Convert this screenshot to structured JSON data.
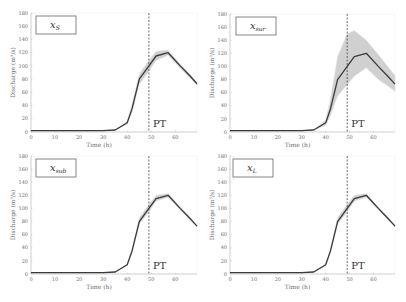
{
  "figure": {
    "width": 406,
    "height": 302,
    "line_color": "#3a3a3a",
    "band_color": "#c8c8c8",
    "band_edge_color": "#e4e4e4",
    "axis_color": "#bdbdbd",
    "pt_line_color": "#444444"
  },
  "chart_data": [
    {
      "type": "line",
      "panel": "top-left",
      "title": "x_S",
      "title_main": "x",
      "title_sub": "S",
      "xlabel": "Time (h)",
      "ylabel": "Discharge (m³/s)",
      "xlim": [
        0,
        69
      ],
      "ylim": [
        0,
        180
      ],
      "xticks": [
        0,
        10,
        20,
        30,
        40,
        50,
        60
      ],
      "yticks": [
        0,
        20,
        40,
        60,
        80,
        100,
        120,
        140,
        160,
        180
      ],
      "annotation": {
        "text": "PT",
        "x": 49
      },
      "series": [
        {
          "name": "Discharge",
          "x": [
            0,
            10,
            20,
            30,
            35,
            40,
            42,
            45,
            49,
            52,
            57,
            62,
            66,
            69
          ],
          "values": [
            2,
            2,
            2,
            2,
            3,
            14,
            35,
            80,
            100,
            115,
            120,
            100,
            85,
            73
          ]
        }
      ],
      "band": {
        "lower": [
          2,
          2,
          2,
          2,
          3,
          12,
          30,
          72,
          92,
          108,
          116,
          97,
          82,
          71
        ],
        "upper": [
          2,
          2,
          2,
          2,
          3,
          16,
          42,
          88,
          108,
          122,
          124,
          103,
          88,
          75
        ]
      }
    },
    {
      "type": "line",
      "panel": "top-right",
      "title": "x_sur",
      "title_main": "x",
      "title_sub": "sur",
      "xlabel": "Time (h)",
      "ylabel": "Discharge (m³/s)",
      "xlim": [
        0,
        69
      ],
      "ylim": [
        0,
        180
      ],
      "xticks": [
        0,
        10,
        20,
        30,
        40,
        50,
        60
      ],
      "yticks": [
        0,
        20,
        40,
        60,
        80,
        100,
        120,
        140,
        160,
        180
      ],
      "annotation": {
        "text": "PT",
        "x": 49
      },
      "series": [
        {
          "name": "Discharge",
          "x": [
            0,
            10,
            20,
            30,
            35,
            40,
            42,
            45,
            49,
            52,
            57,
            62,
            66,
            69
          ],
          "values": [
            2,
            2,
            2,
            2,
            3,
            14,
            35,
            80,
            100,
            115,
            120,
            100,
            85,
            73
          ]
        }
      ],
      "band": {
        "lower": [
          2,
          2,
          2,
          2,
          3,
          10,
          25,
          55,
          72,
          85,
          98,
          80,
          70,
          62
        ],
        "upper": [
          2,
          2,
          2,
          2,
          3,
          18,
          50,
          115,
          150,
          155,
          140,
          118,
          100,
          86
        ]
      }
    },
    {
      "type": "line",
      "panel": "bottom-left",
      "title": "x_sub",
      "title_main": "x",
      "title_sub": "sub",
      "xlabel": "Time (h)",
      "ylabel": "Discharge (m³/s)",
      "xlim": [
        0,
        69
      ],
      "ylim": [
        0,
        180
      ],
      "xticks": [
        0,
        10,
        20,
        30,
        40,
        50,
        60
      ],
      "yticks": [
        0,
        20,
        40,
        60,
        80,
        100,
        120,
        140,
        160,
        180
      ],
      "annotation": {
        "text": "PT",
        "x": 49
      },
      "series": [
        {
          "name": "Discharge",
          "x": [
            0,
            10,
            20,
            30,
            35,
            40,
            42,
            45,
            49,
            52,
            57,
            62,
            66,
            69
          ],
          "values": [
            2,
            2,
            2,
            2,
            3,
            14,
            35,
            80,
            100,
            115,
            120,
            100,
            85,
            73
          ]
        }
      ],
      "band": {
        "lower": [
          2,
          2,
          2,
          2,
          3,
          13,
          32,
          76,
          95,
          111,
          117,
          98,
          83,
          72
        ],
        "upper": [
          2,
          2,
          2,
          2,
          3,
          15,
          38,
          86,
          106,
          120,
          123,
          102,
          87,
          74
        ]
      }
    },
    {
      "type": "line",
      "panel": "bottom-right",
      "title": "x_L",
      "title_main": "x",
      "title_sub": "L",
      "xlabel": "Time (h)",
      "ylabel": "Discharge (m³/s)",
      "xlim": [
        0,
        69
      ],
      "ylim": [
        0,
        180
      ],
      "xticks": [
        0,
        10,
        20,
        30,
        40,
        50,
        60
      ],
      "yticks": [
        0,
        20,
        40,
        60,
        80,
        100,
        120,
        140,
        160,
        180
      ],
      "annotation": {
        "text": "PT",
        "x": 49
      },
      "series": [
        {
          "name": "Discharge",
          "x": [
            0,
            10,
            20,
            30,
            35,
            40,
            42,
            45,
            49,
            52,
            57,
            62,
            66,
            69
          ],
          "values": [
            2,
            2,
            2,
            2,
            3,
            14,
            35,
            80,
            100,
            115,
            120,
            100,
            85,
            73
          ]
        }
      ],
      "band": {
        "lower": [
          2,
          2,
          2,
          2,
          3,
          13,
          32,
          76,
          95,
          111,
          117,
          98,
          83,
          72
        ],
        "upper": [
          2,
          2,
          2,
          2,
          3,
          15,
          38,
          86,
          106,
          120,
          123,
          102,
          87,
          74
        ]
      }
    }
  ],
  "layout": [
    {
      "left": 31,
      "right": 197,
      "top": 13,
      "bottom": 132,
      "box": [
        36,
        16,
        40,
        18
      ]
    },
    {
      "left": 230,
      "right": 395,
      "top": 14,
      "bottom": 132,
      "box": [
        236,
        17,
        40,
        18
      ]
    },
    {
      "left": 31,
      "right": 197,
      "top": 156,
      "bottom": 274,
      "box": [
        36,
        159,
        40,
        18
      ]
    },
    {
      "left": 230,
      "right": 395,
      "top": 156,
      "bottom": 274,
      "box": [
        233,
        159,
        40,
        18
      ]
    }
  ]
}
